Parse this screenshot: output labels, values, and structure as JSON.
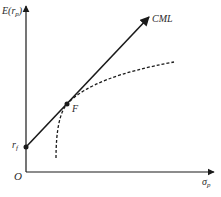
{
  "diagram": {
    "y_axis": {
      "label_main": "E(r",
      "label_sub": "p",
      "label_close": ")"
    },
    "x_axis": {
      "label_main": "σ",
      "label_sub": "p"
    },
    "origin_label": "O",
    "points": {
      "risk_free": {
        "label_main": "r",
        "label_sub": "f"
      },
      "market": {
        "label": "F"
      }
    },
    "lines": {
      "cml": {
        "label": "CML"
      },
      "efficient_frontier": {
        "style": "dashed"
      }
    },
    "colors": {
      "stroke": "#1a1a1a",
      "text": "#2a2a2a",
      "background": "#ffffff"
    }
  }
}
